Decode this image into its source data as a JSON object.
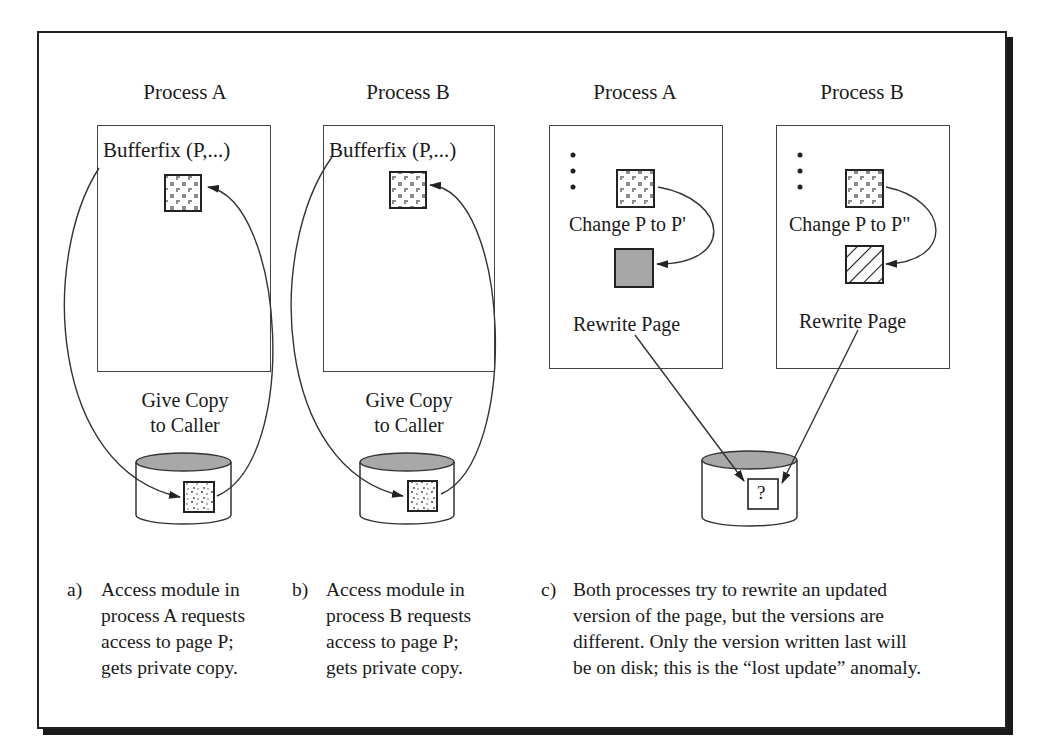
{
  "left_scenario": {
    "process_a": {
      "title": "Process A",
      "call_label": "Bufferfix (P,...)",
      "disk_label_line1": "Give Copy",
      "disk_label_line2": "to Caller"
    },
    "process_b": {
      "title": "Process B",
      "call_label": "Bufferfix (P,...)",
      "disk_label_line1": "Give Copy",
      "disk_label_line2": "to Caller"
    }
  },
  "right_scenario": {
    "process_a": {
      "title": "Process A",
      "ellipsis": "•\n•\n•",
      "change_label": "Change P to P'",
      "rewrite_label": "Rewrite Page",
      "new_page_fill": "gray"
    },
    "process_b": {
      "title": "Process B",
      "change_label": "Change P to P\"",
      "rewrite_label": "Rewrite Page",
      "new_page_fill": "hatched"
    },
    "disk_page_label": "?"
  },
  "captions": {
    "a": {
      "tag": "a)",
      "lines": [
        "Access module in",
        "process A requests",
        "access to page P;",
        "gets private copy."
      ]
    },
    "b": {
      "tag": "b)",
      "lines": [
        "Access module in",
        "process B requests",
        "access to page P;",
        "gets private copy."
      ]
    },
    "c": {
      "tag": "c)",
      "lines": [
        "Both processes try to rewrite an updated",
        "version of the page, but the versions are",
        "different. Only the version written last will",
        "be on disk; this is the “lost update” anomaly."
      ]
    }
  },
  "colors": {
    "line": "#333333",
    "disk_top": "#a8a8a8",
    "gray_page": "#a6a6a6",
    "frame_shadow": "#1a1a1a"
  }
}
